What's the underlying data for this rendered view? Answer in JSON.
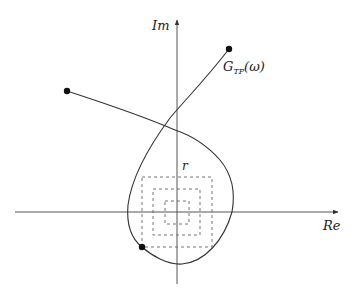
{
  "diagram": {
    "type": "nyquist-plot",
    "axes": {
      "real_label": "Re",
      "imag_label": "Im"
    },
    "curve": {
      "label_main": "G",
      "label_sub": "TP",
      "label_arg": "(ω)"
    },
    "radius_label": "r",
    "markers": [
      {
        "name": "upper-right-endpoint",
        "x": 229,
        "y": 49
      },
      {
        "name": "left-endpoint",
        "x": 67,
        "y": 91
      },
      {
        "name": "lower-left-point",
        "x": 142,
        "y": 247
      }
    ],
    "uncertainty_squares": [
      {
        "name": "outer",
        "x": 142,
        "y": 177,
        "w": 70,
        "h": 70
      },
      {
        "name": "middle",
        "x": 153,
        "y": 189,
        "w": 47,
        "h": 46
      },
      {
        "name": "inner",
        "x": 165,
        "y": 201,
        "w": 24,
        "h": 23
      }
    ],
    "colors": {
      "stroke": "#333333",
      "dashed": "#555555",
      "background": "#ffffff"
    }
  }
}
